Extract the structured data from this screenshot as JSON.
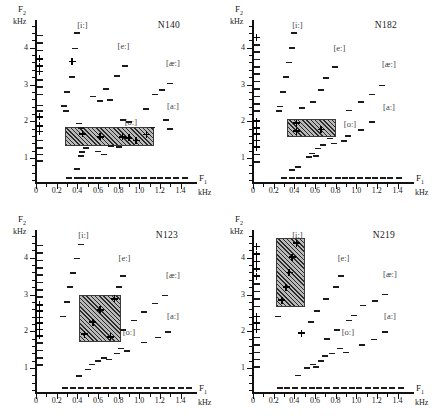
{
  "figure": {
    "type": "scatter-grid",
    "panels_per_row": 2,
    "axis": {
      "x_title": "F",
      "x_sub": "1",
      "x_unit": "kHz",
      "y_title": "F",
      "y_sub": "2",
      "y_unit": "kHz",
      "x_ticks": [
        "0",
        "0.2",
        "0.4",
        "0.6",
        "0.8",
        "1.0",
        "1.2",
        "1.4"
      ],
      "x_tick_values": [
        0,
        0.2,
        0.4,
        0.6,
        0.8,
        1.0,
        1.2,
        1.4
      ],
      "y_ticks": [
        "1",
        "2",
        "3",
        "4"
      ],
      "y_tick_values": [
        1,
        2,
        3,
        4
      ],
      "xlim": [
        0,
        1.55
      ],
      "ylim": [
        0.35,
        4.7
      ]
    },
    "vowel_labels": [
      "[i:]",
      "[e:]",
      "[æ:]",
      "[a:]",
      "[o:]"
    ]
  },
  "chart_data": {
    "type": "scatter",
    "title": "",
    "xlabel": "F1 (kHz)",
    "ylabel": "F2 (kHz)",
    "xlim": [
      0,
      1.55
    ],
    "ylim": [
      0.35,
      4.7
    ],
    "grid": false,
    "legend": "none",
    "panels": [
      {
        "speaker": "N140",
        "speaker_pos": {
          "x": 1.18,
          "y": 4.62
        },
        "annotations": [
          {
            "text": "[i:]",
            "x": 0.4,
            "y": 4.62
          },
          {
            "text": "[e:]",
            "x": 0.79,
            "y": 4.05
          },
          {
            "text": "[æ:]",
            "x": 1.26,
            "y": 3.58
          },
          {
            "text": "[a:]",
            "x": 1.27,
            "y": 2.42
          },
          {
            "text": "[o:]",
            "x": 0.86,
            "y": 1.98
          },
          {
            "text": "F1-axis-row",
            "x": 0,
            "y": 0
          }
        ],
        "box": {
          "x0": 0.28,
          "x1": 1.12,
          "y0": 1.38,
          "y1": 1.85
        },
        "plus_points": [
          {
            "x": 0.035,
            "y": 3.7
          },
          {
            "x": 0.035,
            "y": 3.5
          },
          {
            "x": 0.035,
            "y": 3.35
          },
          {
            "x": 0.035,
            "y": 2.12
          },
          {
            "x": 0.035,
            "y": 1.88
          },
          {
            "x": 0.035,
            "y": 1.72
          },
          {
            "x": 0.35,
            "y": 3.63
          },
          {
            "x": 0.45,
            "y": 1.66
          },
          {
            "x": 0.62,
            "y": 1.58
          },
          {
            "x": 0.84,
            "y": 1.58
          },
          {
            "x": 0.9,
            "y": 1.55
          },
          {
            "x": 0.97,
            "y": 1.48
          },
          {
            "x": 1.07,
            "y": 1.64
          }
        ],
        "dash_points": [
          {
            "x": 0.035,
            "y": 4.35
          },
          {
            "x": 0.035,
            "y": 4.15
          },
          {
            "x": 0.035,
            "y": 3.95
          },
          {
            "x": 0.035,
            "y": 3.15
          },
          {
            "x": 0.035,
            "y": 2.95
          },
          {
            "x": 0.035,
            "y": 2.75
          },
          {
            "x": 0.035,
            "y": 2.45
          },
          {
            "x": 0.035,
            "y": 2.3
          },
          {
            "x": 0.035,
            "y": 1.5
          },
          {
            "x": 0.035,
            "y": 1.3
          },
          {
            "x": 0.035,
            "y": 1.12
          },
          {
            "x": 0.035,
            "y": 0.95
          },
          {
            "x": 0.4,
            "y": 4.42
          },
          {
            "x": 0.38,
            "y": 4.0
          },
          {
            "x": 0.35,
            "y": 3.22
          },
          {
            "x": 0.3,
            "y": 2.82
          },
          {
            "x": 0.27,
            "y": 2.44
          },
          {
            "x": 0.29,
            "y": 2.3
          },
          {
            "x": 0.42,
            "y": 1.96
          },
          {
            "x": 0.44,
            "y": 1.84
          },
          {
            "x": 0.48,
            "y": 1.3
          },
          {
            "x": 0.45,
            "y": 1.18
          },
          {
            "x": 0.44,
            "y": 1.08
          },
          {
            "x": 0.4,
            "y": 0.72
          },
          {
            "x": 0.55,
            "y": 2.7
          },
          {
            "x": 0.62,
            "y": 2.58
          },
          {
            "x": 0.68,
            "y": 2.9
          },
          {
            "x": 0.6,
            "y": 1.2
          },
          {
            "x": 0.66,
            "y": 1.12
          },
          {
            "x": 0.72,
            "y": 2.6
          },
          {
            "x": 0.78,
            "y": 3.25
          },
          {
            "x": 0.86,
            "y": 3.52
          },
          {
            "x": 0.73,
            "y": 1.35
          },
          {
            "x": 0.8,
            "y": 1.32
          },
          {
            "x": 0.84,
            "y": 2.05
          },
          {
            "x": 0.9,
            "y": 2.0
          },
          {
            "x": 1.07,
            "y": 2.35
          },
          {
            "x": 1.15,
            "y": 2.75
          },
          {
            "x": 1.22,
            "y": 2.88
          },
          {
            "x": 1.3,
            "y": 3.05
          },
          {
            "x": 1.26,
            "y": 2.05
          },
          {
            "x": 1.12,
            "y": 1.85
          },
          {
            "x": 1.3,
            "y": 1.82
          }
        ],
        "baseline_marks": [
          0.32,
          0.4,
          0.46,
          0.53,
          0.6,
          0.68,
          0.75,
          0.83,
          0.9,
          0.98,
          1.05,
          1.13,
          1.2,
          1.28,
          1.36,
          1.44
        ],
        "baseline_y": 0.48
      },
      {
        "speaker": "N182",
        "speaker_pos": {
          "x": 1.18,
          "y": 4.62
        },
        "annotations": [
          {
            "text": "[i:]",
            "x": 0.38,
            "y": 4.62
          },
          {
            "text": "[e:]",
            "x": 0.78,
            "y": 4.0
          },
          {
            "text": "[æ:]",
            "x": 1.25,
            "y": 3.55
          },
          {
            "text": "[a:]",
            "x": 1.26,
            "y": 2.38
          },
          {
            "text": "[o:]",
            "x": 0.88,
            "y": 1.92
          }
        ],
        "box": {
          "x0": 0.33,
          "x1": 0.78,
          "y0": 1.62,
          "y1": 2.05
        },
        "plus_points": [
          {
            "x": 0.035,
            "y": 4.28
          },
          {
            "x": 0.035,
            "y": 2.0
          },
          {
            "x": 0.035,
            "y": 1.82
          },
          {
            "x": 0.035,
            "y": 1.65
          },
          {
            "x": 0.035,
            "y": 1.48
          },
          {
            "x": 0.035,
            "y": 1.3
          },
          {
            "x": 0.42,
            "y": 1.95
          },
          {
            "x": 0.42,
            "y": 1.73
          },
          {
            "x": 0.66,
            "y": 1.78
          }
        ],
        "dash_points": [
          {
            "x": 0.035,
            "y": 4.1
          },
          {
            "x": 0.035,
            "y": 3.9
          },
          {
            "x": 0.035,
            "y": 3.7
          },
          {
            "x": 0.035,
            "y": 3.5
          },
          {
            "x": 0.035,
            "y": 3.3
          },
          {
            "x": 0.035,
            "y": 3.1
          },
          {
            "x": 0.035,
            "y": 2.9
          },
          {
            "x": 0.035,
            "y": 2.7
          },
          {
            "x": 0.035,
            "y": 2.5
          },
          {
            "x": 0.035,
            "y": 2.3
          },
          {
            "x": 0.035,
            "y": 1.12
          },
          {
            "x": 0.035,
            "y": 0.92
          },
          {
            "x": 0.4,
            "y": 4.42
          },
          {
            "x": 0.38,
            "y": 4.02
          },
          {
            "x": 0.35,
            "y": 3.62
          },
          {
            "x": 0.32,
            "y": 3.22
          },
          {
            "x": 0.29,
            "y": 2.82
          },
          {
            "x": 0.26,
            "y": 2.42
          },
          {
            "x": 0.25,
            "y": 2.3
          },
          {
            "x": 0.47,
            "y": 2.38
          },
          {
            "x": 0.38,
            "y": 0.7
          },
          {
            "x": 0.44,
            "y": 0.78
          },
          {
            "x": 0.58,
            "y": 2.55
          },
          {
            "x": 0.66,
            "y": 2.88
          },
          {
            "x": 0.71,
            "y": 3.2
          },
          {
            "x": 0.79,
            "y": 3.5
          },
          {
            "x": 0.54,
            "y": 1.05
          },
          {
            "x": 0.57,
            "y": 1.15
          },
          {
            "x": 0.63,
            "y": 1.28
          },
          {
            "x": 0.61,
            "y": 1.08
          },
          {
            "x": 0.68,
            "y": 1.38
          },
          {
            "x": 0.75,
            "y": 1.55
          },
          {
            "x": 0.78,
            "y": 1.42
          },
          {
            "x": 0.88,
            "y": 1.48
          },
          {
            "x": 0.92,
            "y": 1.62
          },
          {
            "x": 0.93,
            "y": 2.32
          },
          {
            "x": 1.05,
            "y": 2.55
          },
          {
            "x": 1.15,
            "y": 2.75
          },
          {
            "x": 1.25,
            "y": 3.0
          },
          {
            "x": 1.05,
            "y": 1.78
          },
          {
            "x": 1.15,
            "y": 2.0
          }
        ],
        "baseline_marks": [
          0.3,
          0.38,
          0.45,
          0.52,
          0.6,
          0.67,
          0.74,
          0.82,
          0.89,
          0.96,
          1.04,
          1.11,
          1.18,
          1.26,
          1.33,
          1.41
        ],
        "baseline_y": 0.48
      },
      {
        "speaker": "N123",
        "speaker_pos": {
          "x": 1.16,
          "y": 4.62
        },
        "annotations": [
          {
            "text": "[i:]",
            "x": 0.41,
            "y": 4.62
          },
          {
            "text": "[e:]",
            "x": 0.8,
            "y": 4.0
          },
          {
            "text": "[æ:]",
            "x": 1.26,
            "y": 3.52
          },
          {
            "text": "[a:]",
            "x": 1.27,
            "y": 2.42
          },
          {
            "text": "[o:]",
            "x": 0.84,
            "y": 1.98
          }
        ],
        "box": {
          "x0": 0.42,
          "x1": 0.8,
          "y0": 1.75,
          "y1": 3.0
        },
        "plus_points": [
          {
            "x": 0.035,
            "y": 2.72
          },
          {
            "x": 0.035,
            "y": 2.55
          },
          {
            "x": 0.035,
            "y": 2.38
          },
          {
            "x": 0.035,
            "y": 2.22
          },
          {
            "x": 0.035,
            "y": 2.05
          },
          {
            "x": 0.035,
            "y": 1.88
          },
          {
            "x": 0.76,
            "y": 2.88
          },
          {
            "x": 0.62,
            "y": 2.58
          },
          {
            "x": 0.55,
            "y": 2.25
          },
          {
            "x": 0.47,
            "y": 1.92
          },
          {
            "x": 0.72,
            "y": 1.85
          }
        ],
        "dash_points": [
          {
            "x": 0.035,
            "y": 4.35
          },
          {
            "x": 0.035,
            "y": 4.15
          },
          {
            "x": 0.035,
            "y": 3.95
          },
          {
            "x": 0.035,
            "y": 3.75
          },
          {
            "x": 0.035,
            "y": 3.55
          },
          {
            "x": 0.035,
            "y": 3.35
          },
          {
            "x": 0.035,
            "y": 3.15
          },
          {
            "x": 0.035,
            "y": 2.95
          },
          {
            "x": 0.035,
            "y": 1.7
          },
          {
            "x": 0.035,
            "y": 1.5
          },
          {
            "x": 0.035,
            "y": 1.3
          },
          {
            "x": 0.035,
            "y": 1.1
          },
          {
            "x": 0.44,
            "y": 4.38
          },
          {
            "x": 0.4,
            "y": 4.0
          },
          {
            "x": 0.36,
            "y": 3.6
          },
          {
            "x": 0.33,
            "y": 3.22
          },
          {
            "x": 0.3,
            "y": 2.82
          },
          {
            "x": 0.26,
            "y": 2.42
          },
          {
            "x": 0.84,
            "y": 3.52
          },
          {
            "x": 0.8,
            "y": 3.22
          },
          {
            "x": 0.84,
            "y": 2.05
          },
          {
            "x": 0.42,
            "y": 0.8
          },
          {
            "x": 0.5,
            "y": 0.98
          },
          {
            "x": 0.54,
            "y": 1.12
          },
          {
            "x": 0.6,
            "y": 1.22
          },
          {
            "x": 0.66,
            "y": 1.3
          },
          {
            "x": 0.71,
            "y": 1.25
          },
          {
            "x": 0.78,
            "y": 1.42
          },
          {
            "x": 0.82,
            "y": 1.55
          },
          {
            "x": 0.88,
            "y": 1.48
          },
          {
            "x": 0.95,
            "y": 2.32
          },
          {
            "x": 1.05,
            "y": 2.55
          },
          {
            "x": 1.15,
            "y": 2.78
          },
          {
            "x": 1.25,
            "y": 3.0
          },
          {
            "x": 1.05,
            "y": 1.72
          },
          {
            "x": 1.18,
            "y": 1.85
          },
          {
            "x": 1.28,
            "y": 2.0
          }
        ],
        "baseline_marks": [
          0.28,
          0.36,
          0.44,
          0.52,
          0.6,
          0.68,
          0.76,
          0.84,
          0.92,
          1.0,
          1.08,
          1.16,
          1.24,
          1.32,
          1.4,
          1.48
        ],
        "baseline_y": 0.48
      },
      {
        "speaker": "N219",
        "speaker_pos": {
          "x": 1.16,
          "y": 4.62
        },
        "annotations": [
          {
            "text": "[i:]",
            "x": 0.38,
            "y": 4.62
          },
          {
            "text": "[e:]",
            "x": 0.82,
            "y": 4.0
          },
          {
            "text": "[æ:]",
            "x": 1.26,
            "y": 3.55
          },
          {
            "text": "[a:]",
            "x": 1.27,
            "y": 2.42
          },
          {
            "text": "[o:]",
            "x": 0.86,
            "y": 1.98
          }
        ],
        "box": {
          "x0": 0.22,
          "x1": 0.48,
          "y0": 2.72,
          "y1": 4.55
        },
        "plus_points": [
          {
            "x": 0.035,
            "y": 4.3
          },
          {
            "x": 0.035,
            "y": 4.1
          },
          {
            "x": 0.035,
            "y": 3.9
          },
          {
            "x": 0.035,
            "y": 3.7
          },
          {
            "x": 0.035,
            "y": 3.5
          },
          {
            "x": 0.035,
            "y": 2.4
          },
          {
            "x": 0.035,
            "y": 2.22
          },
          {
            "x": 0.035,
            "y": 2.05
          },
          {
            "x": 0.42,
            "y": 4.4
          },
          {
            "x": 0.38,
            "y": 4.02
          },
          {
            "x": 0.35,
            "y": 3.6
          },
          {
            "x": 0.32,
            "y": 3.2
          },
          {
            "x": 0.28,
            "y": 2.85
          },
          {
            "x": 0.47,
            "y": 1.95
          }
        ],
        "dash_points": [
          {
            "x": 0.035,
            "y": 3.3
          },
          {
            "x": 0.035,
            "y": 3.1
          },
          {
            "x": 0.035,
            "y": 2.9
          },
          {
            "x": 0.035,
            "y": 2.7
          },
          {
            "x": 0.035,
            "y": 1.85
          },
          {
            "x": 0.035,
            "y": 1.65
          },
          {
            "x": 0.035,
            "y": 1.45
          },
          {
            "x": 0.035,
            "y": 1.25
          },
          {
            "x": 0.035,
            "y": 1.05
          },
          {
            "x": 0.24,
            "y": 2.42
          },
          {
            "x": 0.44,
            "y": 0.82
          },
          {
            "x": 0.52,
            "y": 1.02
          },
          {
            "x": 0.58,
            "y": 1.12
          },
          {
            "x": 0.56,
            "y": 2.28
          },
          {
            "x": 0.62,
            "y": 2.58
          },
          {
            "x": 0.61,
            "y": 1.05
          },
          {
            "x": 0.66,
            "y": 1.22
          },
          {
            "x": 0.7,
            "y": 1.35
          },
          {
            "x": 0.72,
            "y": 1.82
          },
          {
            "x": 0.71,
            "y": 2.9
          },
          {
            "x": 0.77,
            "y": 1.42
          },
          {
            "x": 0.8,
            "y": 3.22
          },
          {
            "x": 0.85,
            "y": 3.52
          },
          {
            "x": 0.81,
            "y": 2.05
          },
          {
            "x": 0.84,
            "y": 1.55
          },
          {
            "x": 0.9,
            "y": 1.45
          },
          {
            "x": 0.93,
            "y": 2.32
          },
          {
            "x": 0.98,
            "y": 2.45
          },
          {
            "x": 1.06,
            "y": 1.65
          },
          {
            "x": 1.07,
            "y": 2.72
          },
          {
            "x": 1.18,
            "y": 2.85
          },
          {
            "x": 1.17,
            "y": 1.8
          },
          {
            "x": 1.28,
            "y": 3.02
          },
          {
            "x": 1.28,
            "y": 2.0
          }
        ],
        "baseline_marks": [
          0.26,
          0.33,
          0.41,
          0.49,
          0.57,
          0.64,
          0.72,
          0.8,
          0.88,
          0.96,
          1.03,
          1.11,
          1.19,
          1.27,
          1.35,
          1.43
        ],
        "baseline_y": 0.48
      }
    ]
  }
}
